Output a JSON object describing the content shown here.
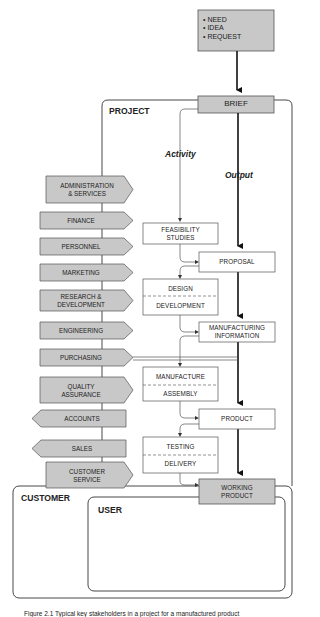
{
  "inputs": {
    "items": [
      "• NEED",
      "• IDEA",
      "• REQUEST"
    ]
  },
  "regions": {
    "project": "PROJECT",
    "customer": "CUSTOMER",
    "user": "USER"
  },
  "flow_labels": {
    "activity": "Activity",
    "output": "Output"
  },
  "outputs": {
    "brief": "BRIEF",
    "proposal": "PROPOSAL",
    "manufacturing_information": [
      "MANUFACTURING",
      "INFORMATION"
    ],
    "product": "PRODUCT",
    "working_product": [
      "WORKING",
      "PRODUCT"
    ]
  },
  "activities": {
    "feasibility": [
      "FEASIBILITY",
      "STUDIES"
    ],
    "design": "DESIGN",
    "development": "DEVELOPMENT",
    "manufacture": "MANUFACTURE",
    "assembly": "ASSEMBLY",
    "testing": "TESTING",
    "delivery": "DELIVERY"
  },
  "departments": [
    {
      "line1": "ADMINISTRATION",
      "line2": "& SERVICES",
      "direction": "right"
    },
    {
      "line1": "FINANCE",
      "line2": "",
      "direction": "right"
    },
    {
      "line1": "PERSONNEL",
      "line2": "",
      "direction": "right"
    },
    {
      "line1": "MARKETING",
      "line2": "",
      "direction": "right"
    },
    {
      "line1": "RESEARCH &",
      "line2": "DEVELOPMENT",
      "direction": "right"
    },
    {
      "line1": "ENGINEERING",
      "line2": "",
      "direction": "right"
    },
    {
      "line1": "PURCHASING",
      "line2": "",
      "direction": "right"
    },
    {
      "line1": "QUALITY",
      "line2": "ASSURANCE",
      "direction": "right"
    },
    {
      "line1": "ACCOUNTS",
      "line2": "",
      "direction": "left"
    },
    {
      "line1": "SALES",
      "line2": "",
      "direction": "left"
    },
    {
      "line1": "CUSTOMER",
      "line2": "SERVICE",
      "direction": "right"
    }
  ],
  "caption": "Figure 2.1   Typical key stakeholders in a project for a manufactured product",
  "colors": {
    "fill_grey": "#c8c8c8",
    "stroke": "#333333",
    "thin_stroke": "#555555",
    "background": "#ffffff"
  }
}
